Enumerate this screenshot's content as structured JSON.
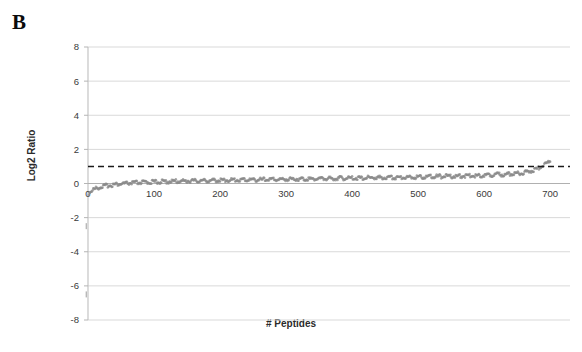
{
  "figure": {
    "panel_label": "B",
    "background_color": "#ffffff"
  },
  "chart_data": {
    "type": "scatter",
    "title": "",
    "xlabel": "# Peptides",
    "ylabel": "Log2 Ratio",
    "xlim": [
      0,
      730
    ],
    "ylim": [
      -8,
      8
    ],
    "xticks": [
      0,
      100,
      200,
      300,
      400,
      500,
      600,
      700
    ],
    "xticklabels": [
      "0",
      "100",
      "200",
      "300",
      "400",
      "500",
      "600",
      "700"
    ],
    "yticks": [
      -8,
      -6,
      -4,
      -2,
      0,
      2,
      4,
      6,
      8
    ],
    "yticklabels": [
      "-8",
      "-6",
      "-4",
      "-2",
      "0",
      "2",
      "4",
      "6",
      "8"
    ],
    "grid": "horizontal",
    "grid_color": "#d9d9d9",
    "legend": "none",
    "series": [
      {
        "name": "Log2 Ratio (sorted peptides)",
        "marker": "dot",
        "color": "#8a8a8a",
        "n_points": 700,
        "description": "Monotonically increasing sorted log2 ratios forming a dense band",
        "x": [
          1,
          3,
          6,
          10,
          15,
          20,
          26,
          33,
          40,
          48,
          57,
          66,
          76,
          86,
          97,
          108,
          120,
          133,
          146,
          160,
          175,
          190,
          206,
          223,
          240,
          258,
          277,
          296,
          316,
          337,
          358,
          380,
          403,
          427,
          451,
          476,
          502,
          529,
          556,
          584,
          613,
          635,
          652,
          664,
          673,
          680,
          686,
          691,
          695,
          698,
          700
        ],
        "y": [
          -0.62,
          -0.54,
          -0.46,
          -0.38,
          -0.31,
          -0.25,
          -0.2,
          -0.16,
          -0.12,
          -0.09,
          -0.06,
          -0.03,
          -0.01,
          0.01,
          0.03,
          0.04,
          0.06,
          0.07,
          0.09,
          0.1,
          0.11,
          0.12,
          0.14,
          0.15,
          0.16,
          0.17,
          0.18,
          0.19,
          0.21,
          0.22,
          0.23,
          0.25,
          0.26,
          0.28,
          0.29,
          0.31,
          0.33,
          0.35,
          0.37,
          0.4,
          0.44,
          0.48,
          0.54,
          0.61,
          0.7,
          0.8,
          0.92,
          1.04,
          1.15,
          1.24,
          1.32
        ]
      }
    ],
    "threshold_line": {
      "name": "cutoff",
      "orientation": "horizontal",
      "value": 1,
      "style": "dashed",
      "color": "#1a1a1a"
    },
    "outlier_marks": [
      {
        "x": 2,
        "y": -2.5,
        "color": "#b8b8b8"
      },
      {
        "x": 2,
        "y": -6.5,
        "color": "#b8b8b8"
      }
    ]
  }
}
